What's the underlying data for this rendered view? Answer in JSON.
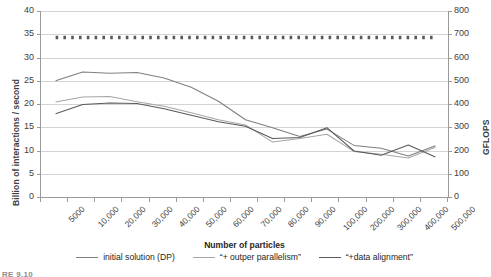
{
  "chart_data": {
    "type": "line",
    "title": "",
    "xlabel": "Number of particles",
    "ylabel": "Billion of interactions / second",
    "y2label": "GFLOPS",
    "categories": [
      "5000",
      "10,000",
      "20,000",
      "30,000",
      "40,000",
      "50,000",
      "60,000",
      "70,000",
      "80,000",
      "90,000",
      "100,000",
      "200,000",
      "300,000",
      "400,000",
      "500,000"
    ],
    "ylim": [
      0,
      40
    ],
    "yticks": [
      0,
      5,
      10,
      15,
      20,
      25,
      30,
      35,
      40
    ],
    "y2lim": [
      0,
      800
    ],
    "y2ticks": [
      0,
      100,
      200,
      300,
      400,
      500,
      600,
      700,
      800
    ],
    "grid": true,
    "legend_position": "bottom",
    "series": [
      {
        "name": "initial solution (DP)",
        "color": "#7f7f7f",
        "style": "solid",
        "values": [
          25.0,
          26.9,
          26.6,
          26.8,
          25.6,
          23.6,
          20.6,
          16.6,
          14.9,
          13.0,
          14.6,
          11.1,
          10.5,
          8.8,
          11.0
        ]
      },
      {
        "name": "“+ outper parallelism”",
        "color": "#a6a6a6",
        "style": "solid",
        "values": [
          20.4,
          21.5,
          21.6,
          20.5,
          19.5,
          18.1,
          16.6,
          15.5,
          11.8,
          12.6,
          13.5,
          9.8,
          9.2,
          8.4,
          10.7
        ]
      },
      {
        "name": "“+data alignment”",
        "color": "#595959",
        "style": "solid",
        "values": [
          17.9,
          19.9,
          20.2,
          20.1,
          19.0,
          17.6,
          16.2,
          15.2,
          12.6,
          12.8,
          14.9,
          9.9,
          9.0,
          11.2,
          8.6
        ]
      },
      {
        "name": "peak reference",
        "color": "#595959",
        "style": "dotted",
        "values": [
          34.3,
          34.3,
          34.3,
          34.3,
          34.3,
          34.3,
          34.3,
          34.3,
          34.3,
          34.3,
          34.3,
          34.3,
          34.3,
          34.3,
          34.3
        ]
      }
    ]
  },
  "legend": {
    "items": [
      {
        "label": "initial solution (DP)",
        "color": "#7f7f7f"
      },
      {
        "label": "“+ outper parallelism”",
        "color": "#a6a6a6"
      },
      {
        "label": "“+data alignment”",
        "color": "#595959"
      }
    ]
  },
  "caption": "RE 9.10"
}
